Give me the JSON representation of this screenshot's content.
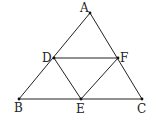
{
  "diagram": {
    "type": "geometry",
    "stroke_color": "#222222",
    "points": {
      "A": {
        "label": "A",
        "x": 90,
        "y": 13,
        "lx": 80,
        "ly": 12
      },
      "B": {
        "label": "B",
        "x": 19,
        "y": 99,
        "lx": 14,
        "ly": 112
      },
      "C": {
        "label": "C",
        "x": 142,
        "y": 99,
        "lx": 137,
        "ly": 113
      },
      "D": {
        "label": "D",
        "x": 54,
        "y": 58,
        "lx": 42,
        "ly": 62
      },
      "E": {
        "label": "E",
        "x": 81,
        "y": 99,
        "lx": 76,
        "ly": 113
      },
      "F": {
        "label": "F",
        "x": 118,
        "y": 58,
        "lx": 120,
        "ly": 62
      }
    },
    "segments": [
      [
        "A",
        "B"
      ],
      [
        "A",
        "C"
      ],
      [
        "B",
        "C"
      ],
      [
        "D",
        "F"
      ],
      [
        "D",
        "E"
      ],
      [
        "E",
        "F"
      ]
    ]
  }
}
